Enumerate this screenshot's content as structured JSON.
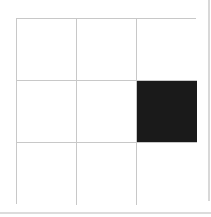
{
  "caption": "",
  "grid": {
    "rows": 3,
    "cols": 3,
    "cells": [
      {
        "row": 1,
        "col": 1,
        "filled": false
      },
      {
        "row": 1,
        "col": 2,
        "filled": false
      },
      {
        "row": 1,
        "col": 3,
        "filled": false
      },
      {
        "row": 2,
        "col": 1,
        "filled": false
      },
      {
        "row": 2,
        "col": 2,
        "filled": false
      },
      {
        "row": 2,
        "col": 3,
        "filled": true
      },
      {
        "row": 3,
        "col": 1,
        "filled": false
      },
      {
        "row": 3,
        "col": 2,
        "filled": false
      },
      {
        "row": 3,
        "col": 3,
        "filled": false
      }
    ],
    "fill_color": "#1a1a1a",
    "line_color": "#c8c8c8"
  }
}
